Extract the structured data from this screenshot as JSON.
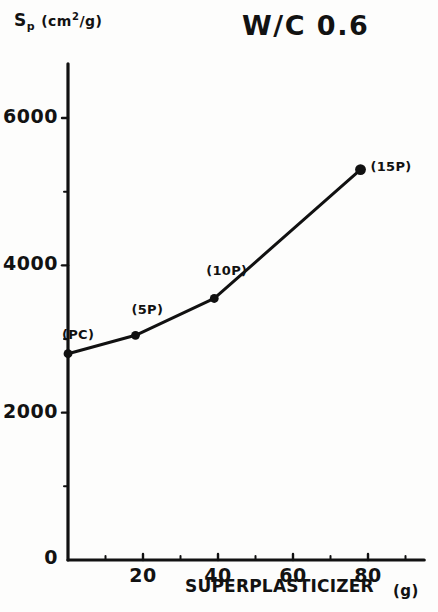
{
  "chart_data": {
    "type": "line",
    "title": "W/C 0.6",
    "xlabel": "SUPERPLASTICIZER",
    "xunit": "(g)",
    "ylabel_symbol": "S",
    "ylabel_sub": "p",
    "ylabel_unit_pre": "(cm",
    "ylabel_unit_sup": "2",
    "ylabel_unit_post": "/g)",
    "x": [
      0,
      18,
      39,
      78
    ],
    "values": [
      2800,
      3050,
      3550,
      5300
    ],
    "point_labels": [
      "(PC)",
      "(5P)",
      "(10P)",
      "(15P)"
    ],
    "xlim": [
      0,
      95
    ],
    "ylim": [
      0,
      6600
    ],
    "xticks_major": [
      0,
      20,
      40,
      60,
      80
    ],
    "xtick_labels": [
      "0",
      "20",
      "40",
      "60",
      "80"
    ],
    "xticks_minor": [
      10,
      30,
      50,
      70,
      90
    ],
    "yticks_major": [
      0,
      2000,
      4000,
      6000
    ],
    "ytick_labels": [
      "0",
      "2000",
      "4000",
      "6000"
    ],
    "yticks_minor": [
      1000,
      3000,
      5000
    ],
    "grid": false,
    "legend": "none",
    "series_color": "#111111",
    "marker": "filled-circle"
  },
  "axis": {
    "zero_label": "0"
  }
}
